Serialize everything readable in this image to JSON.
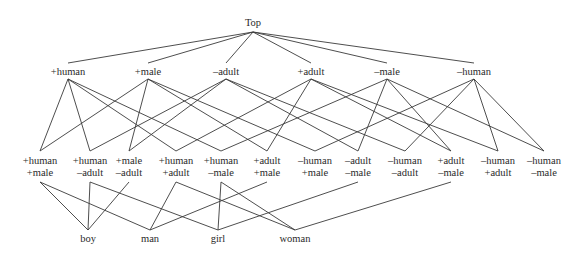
{
  "diagram": {
    "type": "feature lattice",
    "top": {
      "id": "top",
      "label": "Top",
      "x": 253,
      "y": 25
    },
    "level1": [
      {
        "id": "p_human",
        "label": "+human",
        "x": 68
      },
      {
        "id": "p_male",
        "label": "+male",
        "x": 148
      },
      {
        "id": "m_adult",
        "label": "–adult",
        "x": 226
      },
      {
        "id": "p_adult",
        "label": "+adult",
        "x": 311
      },
      {
        "id": "m_male",
        "label": "–male",
        "x": 387
      },
      {
        "id": "m_human",
        "label": "–human",
        "x": 474
      }
    ],
    "level2": [
      {
        "id": "hm",
        "line1": "+human",
        "line2": "+male",
        "x": 40
      },
      {
        "id": "ha",
        "line1": "+human",
        "line2": "–adult",
        "x": 90
      },
      {
        "id": "ma",
        "line1": "+male",
        "line2": "–adult",
        "x": 129
      },
      {
        "id": "hA",
        "line1": "+human",
        "line2": "+adult",
        "x": 176
      },
      {
        "id": "hf",
        "line1": "+human",
        "line2": "–male",
        "x": 221
      },
      {
        "id": "Am",
        "line1": "+adult",
        "line2": "+male",
        "x": 267
      },
      {
        "id": "nm",
        "line1": "–human",
        "line2": "+male",
        "x": 315
      },
      {
        "id": "af",
        "line1": "–adult",
        "line2": "–male",
        "x": 358
      },
      {
        "id": "na",
        "line1": "–human",
        "line2": "–adult",
        "x": 405
      },
      {
        "id": "Af",
        "line1": "+adult",
        "line2": "–male",
        "x": 451
      },
      {
        "id": "nA",
        "line1": "–human",
        "line2": "+adult",
        "x": 498
      },
      {
        "id": "nf",
        "line1": "–human",
        "line2": "–male",
        "x": 544
      }
    ],
    "words": [
      {
        "id": "boy",
        "label": "boy",
        "x": 88
      },
      {
        "id": "man",
        "label": "man",
        "x": 150
      },
      {
        "id": "girl",
        "label": "girl",
        "x": 218
      },
      {
        "id": "woman",
        "label": "woman",
        "x": 295
      }
    ],
    "edges_top_to_level1": [
      "p_human",
      "p_male",
      "m_adult",
      "p_adult",
      "m_male",
      "m_human"
    ],
    "edges_level1_to_level2": [
      [
        "p_human",
        "hm"
      ],
      [
        "p_human",
        "ha"
      ],
      [
        "p_human",
        "hA"
      ],
      [
        "p_human",
        "hf"
      ],
      [
        "p_male",
        "hm"
      ],
      [
        "p_male",
        "ma"
      ],
      [
        "p_male",
        "Am"
      ],
      [
        "p_male",
        "nm"
      ],
      [
        "m_adult",
        "ha"
      ],
      [
        "m_adult",
        "ma"
      ],
      [
        "m_adult",
        "af"
      ],
      [
        "m_adult",
        "na"
      ],
      [
        "p_adult",
        "hA"
      ],
      [
        "p_adult",
        "Am"
      ],
      [
        "p_adult",
        "Af"
      ],
      [
        "p_adult",
        "nA"
      ],
      [
        "m_male",
        "hf"
      ],
      [
        "m_male",
        "af"
      ],
      [
        "m_male",
        "Af"
      ],
      [
        "m_male",
        "nf"
      ],
      [
        "m_human",
        "nm"
      ],
      [
        "m_human",
        "na"
      ],
      [
        "m_human",
        "nA"
      ],
      [
        "m_human",
        "nf"
      ]
    ],
    "edges_level2_to_words": [
      [
        "hm",
        "boy"
      ],
      [
        "ha",
        "boy"
      ],
      [
        "ma",
        "boy"
      ],
      [
        "hm",
        "man"
      ],
      [
        "hA",
        "man"
      ],
      [
        "Am",
        "man"
      ],
      [
        "ha",
        "girl"
      ],
      [
        "hf",
        "girl"
      ],
      [
        "af",
        "girl"
      ],
      [
        "hA",
        "woman"
      ],
      [
        "hf",
        "woman"
      ],
      [
        "Af",
        "woman"
      ]
    ],
    "line_color": "#3a3a3a"
  }
}
